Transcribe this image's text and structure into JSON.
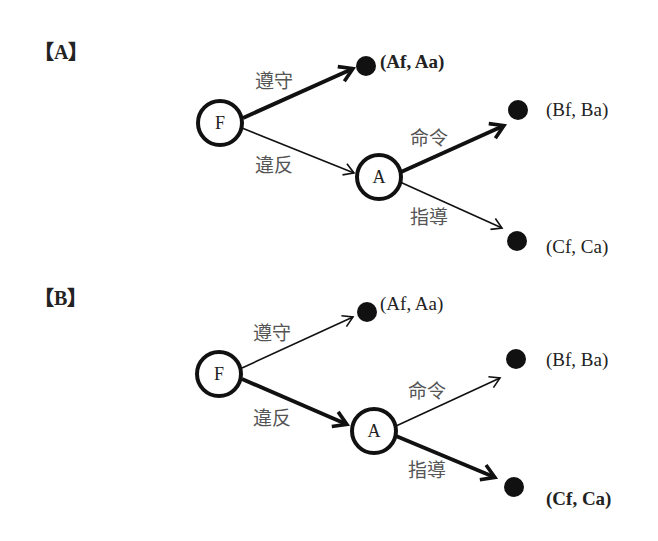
{
  "diagram": {
    "type": "game-tree",
    "panels": [
      {
        "id": "A",
        "label": "【A】",
        "nodes": {
          "F": {
            "label": "F",
            "x": 220,
            "y": 123
          },
          "A": {
            "label": "A",
            "x": 379,
            "y": 177
          }
        },
        "edges": [
          {
            "from": "F",
            "to": "Af",
            "label": "遵守",
            "highlighted": true
          },
          {
            "from": "F",
            "to": "A",
            "label": "違反",
            "highlighted": false
          },
          {
            "from": "A",
            "to": "Bf",
            "label": "命令",
            "highlighted": true
          },
          {
            "from": "A",
            "to": "Cf",
            "label": "指導",
            "highlighted": false
          }
        ],
        "outcomes": [
          {
            "id": "Af",
            "label": "(Af, Aa)",
            "bold": true
          },
          {
            "id": "Bf",
            "label": "(Bf, Ba)",
            "bold": false
          },
          {
            "id": "Cf",
            "label": "(Cf, Ca)",
            "bold": false
          }
        ]
      },
      {
        "id": "B",
        "label": "【B】",
        "nodes": {
          "F": {
            "label": "F",
            "x": 219,
            "y": 374
          },
          "A": {
            "label": "A",
            "x": 374,
            "y": 431
          }
        },
        "edges": [
          {
            "from": "F",
            "to": "Af",
            "label": "遵守",
            "highlighted": false
          },
          {
            "from": "F",
            "to": "A",
            "label": "違反",
            "highlighted": true
          },
          {
            "from": "A",
            "to": "Bf",
            "label": "命令",
            "highlighted": false
          },
          {
            "from": "A",
            "to": "Cf",
            "label": "指導",
            "highlighted": true
          }
        ],
        "outcomes": [
          {
            "id": "Af",
            "label": "(Af, Aa)",
            "bold": false
          },
          {
            "id": "Bf",
            "label": "(Bf, Ba)",
            "bold": false
          },
          {
            "id": "Cf",
            "label": "(Cf, Ca)",
            "bold": true
          }
        ]
      }
    ],
    "colors": {
      "stroke": "#111111",
      "text": "#222222",
      "edge_label": "#555555",
      "background": "#ffffff"
    }
  }
}
